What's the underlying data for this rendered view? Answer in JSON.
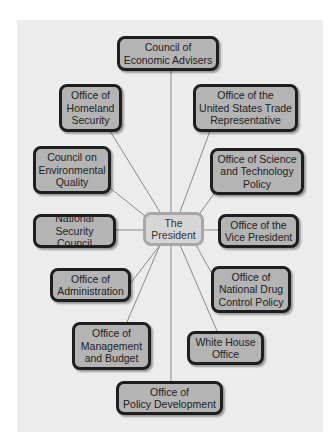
{
  "diagram": {
    "type": "hub-and-spoke organization chart",
    "center": {
      "label": "The\nPresident"
    },
    "colors": {
      "panel": "#ececec",
      "node_fill": "#b4b4b4",
      "node_border": "#1e1e1e",
      "center_fill": "#d6d6d6",
      "center_border": "#a8a8a8",
      "line": "#8a8a8a"
    },
    "nodes": [
      {
        "id": "cea",
        "label": "Council of\nEconomic Advisers"
      },
      {
        "id": "ohs",
        "label": "Office of\nHomeland\nSecurity"
      },
      {
        "id": "ustr",
        "label": "Office of the\nUnited States Trade\nRepresentative"
      },
      {
        "id": "ceq",
        "label": "Council on\nEnvironmental\nQuality"
      },
      {
        "id": "ostp",
        "label": "Office of Science\nand Technology\nPolicy"
      },
      {
        "id": "nsc",
        "label": "National\nSecurity Council"
      },
      {
        "id": "ovp",
        "label": "Office of the\nVice President"
      },
      {
        "id": "oa",
        "label": "Office of\nAdministration"
      },
      {
        "id": "ondcp",
        "label": "Office of\nNational Drug\nControl Policy"
      },
      {
        "id": "omb",
        "label": "Office of\nManagement\nand Budget"
      },
      {
        "id": "who",
        "label": "White House\nOffice"
      },
      {
        "id": "opd",
        "label": "Office of\nPolicy Development"
      }
    ]
  }
}
